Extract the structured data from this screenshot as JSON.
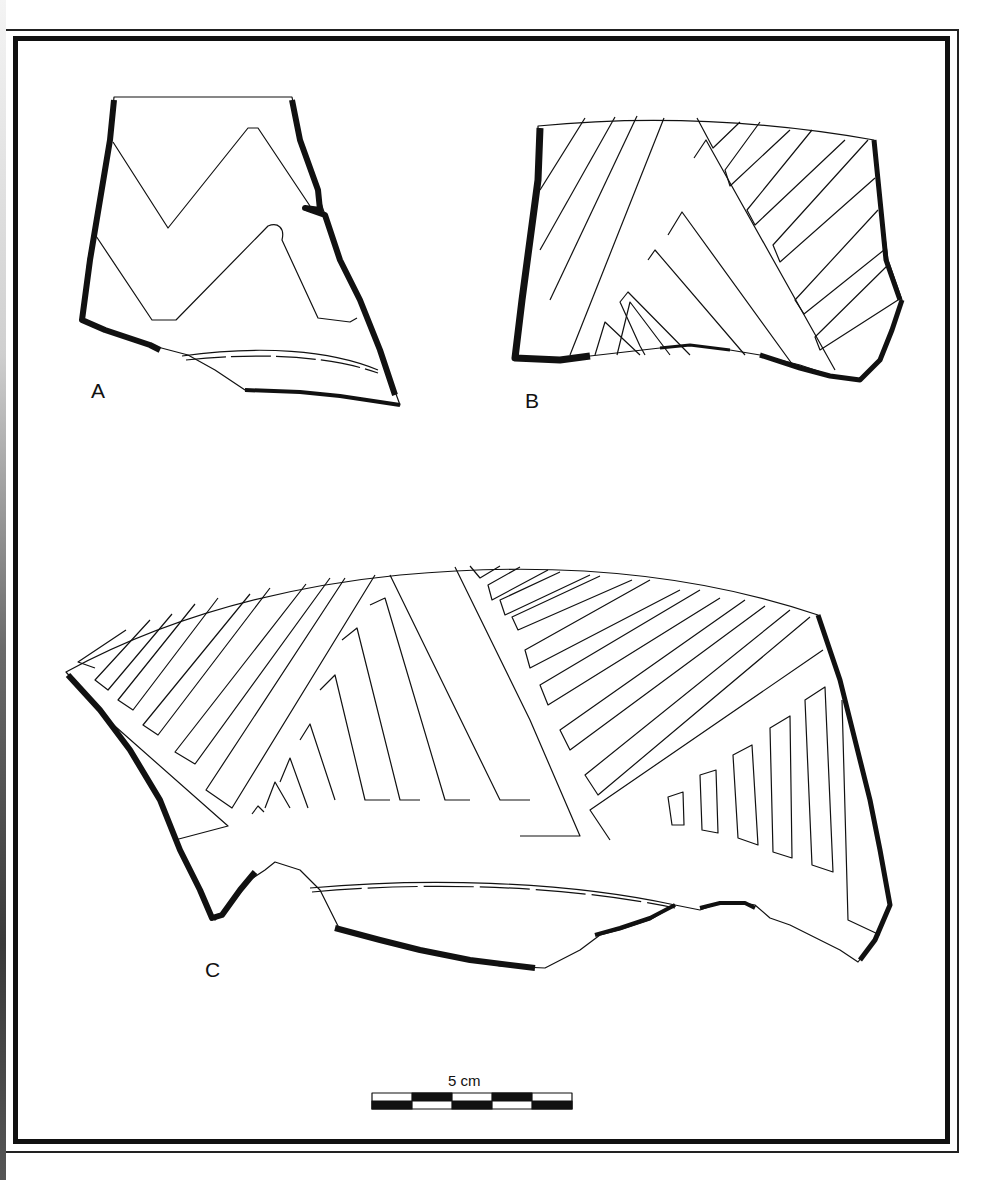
{
  "figure": {
    "type": "archaeological pottery sherd illustration plate",
    "sherds": [
      {
        "id": "A",
        "label": "A",
        "decoration": "incised chevron / zigzag band"
      },
      {
        "id": "B",
        "label": "B",
        "decoration": "incised nested diagonal hatching"
      },
      {
        "id": "C",
        "label": "C",
        "decoration": "incised nested triangles with parallel line fill"
      }
    ],
    "scale_bar": {
      "label": "5 cm",
      "segments": 5
    },
    "colors": {
      "ink": "#111111",
      "paper": "#ffffff"
    }
  }
}
